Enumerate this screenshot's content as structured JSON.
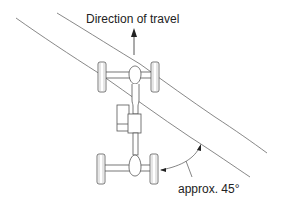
{
  "diagram": {
    "title": "Direction of travel",
    "angle_label": "approx. 45°",
    "colors": {
      "stroke": "#555555",
      "text": "#222222",
      "background": "#ffffff"
    }
  },
  "elements": {
    "arrow": "direction-of-travel-arrow",
    "obstacle": "diagonal-obstacle-edges",
    "front_axle": "front-axle-with-wheels",
    "rear_axle": "rear-axle-with-wheels",
    "driveshaft": "propeller-shaft",
    "transmission": "transmission-and-transfer-case",
    "angle_arc": "45-degree-angle-arc"
  }
}
